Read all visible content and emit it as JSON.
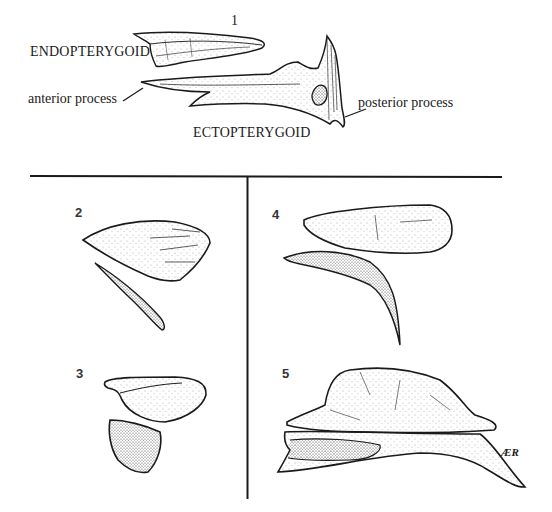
{
  "figure": {
    "panels": [
      {
        "id": "1",
        "number_label": "1",
        "labels": {
          "endopterygoid": "ENDOPTERYGOID",
          "ectopterygoid": "ECTOPTERYGOID",
          "anterior_process": "anterior process",
          "posterior_process": "posterior process"
        }
      },
      {
        "id": "2",
        "number_label": "2"
      },
      {
        "id": "3",
        "number_label": "3"
      },
      {
        "id": "4",
        "number_label": "4"
      },
      {
        "id": "5",
        "number_label": "5"
      }
    ],
    "signature": "ÆR",
    "colors": {
      "ink": "#1a1a1a",
      "background": "#ffffff"
    }
  }
}
